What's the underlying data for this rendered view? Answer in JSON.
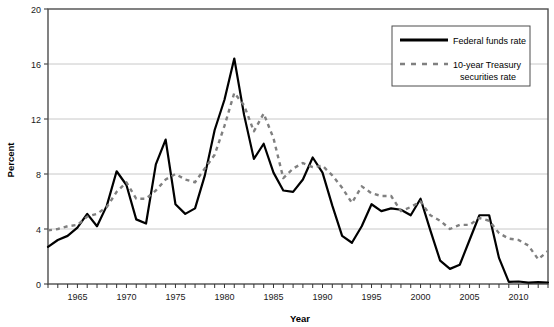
{
  "chart_data": {
    "type": "line",
    "title": "",
    "xlabel": "Year",
    "ylabel": "Percent",
    "xlim": [
      1962,
      2013
    ],
    "ylim": [
      0,
      20
    ],
    "yticks": [
      0,
      4,
      8,
      12,
      16,
      20
    ],
    "xticks": [
      1965,
      1970,
      1975,
      1980,
      1985,
      1990,
      1995,
      2000,
      2005,
      2010
    ],
    "xtick_labels": [
      "1965",
      "1970",
      "1975",
      "1980",
      "1985",
      "1990",
      "1995",
      "2000",
      "2005",
      "2010"
    ],
    "ytick_labels": [
      "0",
      "4",
      "8",
      "12",
      "16",
      "20"
    ],
    "grid": "horizontal",
    "legend_position": "top-right",
    "x": [
      1962,
      1963,
      1964,
      1965,
      1966,
      1967,
      1968,
      1969,
      1970,
      1971,
      1972,
      1973,
      1974,
      1975,
      1976,
      1977,
      1978,
      1979,
      1980,
      1981,
      1982,
      1983,
      1984,
      1985,
      1986,
      1987,
      1988,
      1989,
      1990,
      1991,
      1992,
      1993,
      1994,
      1995,
      1996,
      1997,
      1998,
      1999,
      2000,
      2001,
      2002,
      2003,
      2004,
      2005,
      2006,
      2007,
      2008,
      2009,
      2010,
      2011,
      2012,
      2013
    ],
    "series": [
      {
        "name": "Federal funds rate",
        "style": "solid",
        "color": "#000000",
        "values": [
          2.7,
          3.2,
          3.5,
          4.1,
          5.1,
          4.2,
          5.7,
          8.2,
          7.2,
          4.7,
          4.4,
          8.7,
          10.5,
          5.8,
          5.1,
          5.5,
          7.9,
          11.2,
          13.4,
          16.4,
          12.3,
          9.1,
          10.2,
          8.1,
          6.8,
          6.7,
          7.6,
          9.2,
          8.1,
          5.7,
          3.5,
          3.0,
          4.2,
          5.8,
          5.3,
          5.5,
          5.4,
          5.0,
          6.2,
          3.9,
          1.7,
          1.1,
          1.4,
          3.2,
          5.0,
          5.0,
          1.9,
          0.16,
          0.18,
          0.1,
          0.14,
          0.11
        ]
      },
      {
        "name": "10-year Treasury securities rate",
        "style": "dashed",
        "color": "#808080",
        "values": [
          3.9,
          4.0,
          4.2,
          4.3,
          4.9,
          5.1,
          5.6,
          6.7,
          7.4,
          6.2,
          6.2,
          6.8,
          7.6,
          8.0,
          7.6,
          7.4,
          8.4,
          9.4,
          11.5,
          13.9,
          13.0,
          11.1,
          12.4,
          10.6,
          7.7,
          8.4,
          8.8,
          8.5,
          8.6,
          7.9,
          7.0,
          5.9,
          7.1,
          6.6,
          6.4,
          6.4,
          5.3,
          5.6,
          6.0,
          5.0,
          4.6,
          4.0,
          4.3,
          4.3,
          4.8,
          4.6,
          3.7,
          3.3,
          3.2,
          2.8,
          1.8,
          2.4
        ]
      }
    ]
  },
  "legend": {
    "items": [
      {
        "label": "Federal funds rate",
        "label_line2": "",
        "style": "solid",
        "color": "#000000"
      },
      {
        "label": "10-year Treasury",
        "label_line2": "securities rate",
        "style": "dashed",
        "color": "#808080"
      }
    ]
  },
  "axes": {
    "y_title": "Percent",
    "x_title": "Year"
  }
}
